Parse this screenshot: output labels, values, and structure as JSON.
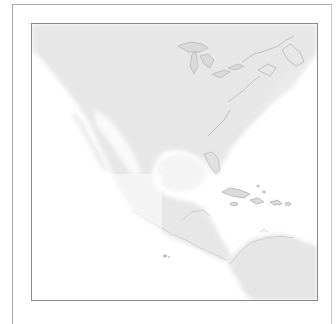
{
  "map": {
    "region": "North and Central America with Caribbean and northern South America",
    "style": "grayscale faded land",
    "colors": {
      "land": "#e6e6e6",
      "coast": "#c4c4c4",
      "water": "#ffffff",
      "frame": "#8a8a8a"
    },
    "features": [
      "Great Lakes",
      "Gulf of Mexico",
      "Caribbean islands",
      "Baja California",
      "Central America",
      "Galapagos Islands",
      "South America"
    ]
  }
}
